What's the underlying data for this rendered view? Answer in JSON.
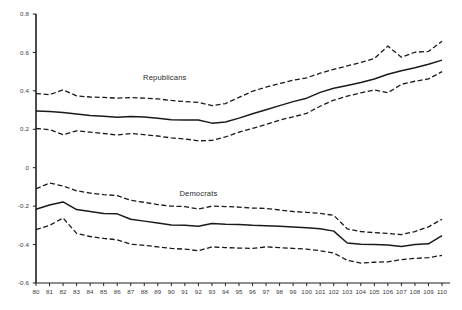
{
  "chart_data": {
    "type": "line",
    "title": "",
    "subtitle": "",
    "xlabel": "",
    "ylabel": "",
    "xlim": [
      80,
      110
    ],
    "ylim": [
      -0.6,
      0.8
    ],
    "grid": false,
    "legend_position": "inline-annotation",
    "x": [
      80,
      81,
      82,
      83,
      84,
      85,
      86,
      87,
      88,
      89,
      90,
      91,
      92,
      93,
      94,
      95,
      96,
      97,
      98,
      99,
      100,
      101,
      102,
      103,
      104,
      105,
      106,
      107,
      108,
      109,
      110
    ],
    "xtick_labels": [
      "80",
      "81",
      "82",
      "83",
      "84",
      "85",
      "86",
      "87",
      "88",
      "89",
      "90",
      "91",
      "92",
      "93",
      "94",
      "95",
      "96",
      "97",
      "98",
      "99",
      "100",
      "101",
      "102",
      "103",
      "104",
      "105",
      "106",
      "107",
      "108",
      "109",
      "110"
    ],
    "ytick_labels": [
      "0.8",
      "0.6",
      "0.4",
      "0.2",
      "0",
      "-0.2",
      "-0.4",
      "-0.6"
    ],
    "ytick_values": [
      0.8,
      0.6,
      0.4,
      0.2,
      0,
      -0.2,
      -0.4,
      -0.6
    ],
    "annotations": [
      {
        "text": "Republicans",
        "x": 89.5,
        "y": 0.465
      },
      {
        "text": "Democrats",
        "x": 92.0,
        "y": -0.135
      }
    ],
    "series": [
      {
        "name": "Republicans",
        "role": "mean",
        "style": "solid",
        "color": "#1a1a1a",
        "values": [
          0.295,
          0.292,
          0.288,
          0.28,
          0.272,
          0.268,
          0.263,
          0.266,
          0.264,
          0.258,
          0.25,
          0.248,
          0.248,
          0.232,
          0.238,
          0.258,
          0.281,
          0.302,
          0.323,
          0.344,
          0.362,
          0.392,
          0.414,
          0.428,
          0.443,
          0.462,
          0.486,
          0.505,
          0.52,
          0.538,
          0.56
        ]
      },
      {
        "name": "Republicans",
        "role": "upper",
        "style": "dashed",
        "color": "#1a1a1a",
        "values": [
          0.386,
          0.38,
          0.405,
          0.374,
          0.368,
          0.366,
          0.362,
          0.365,
          0.362,
          0.358,
          0.35,
          0.344,
          0.34,
          0.323,
          0.334,
          0.366,
          0.398,
          0.42,
          0.438,
          0.455,
          0.468,
          0.492,
          0.512,
          0.53,
          0.548,
          0.568,
          0.633,
          0.575,
          0.601,
          0.605,
          0.658
        ]
      },
      {
        "name": "Republicans",
        "role": "lower",
        "style": "dashed",
        "color": "#1a1a1a",
        "values": [
          0.204,
          0.198,
          0.172,
          0.192,
          0.185,
          0.178,
          0.17,
          0.178,
          0.172,
          0.165,
          0.155,
          0.15,
          0.14,
          0.142,
          0.16,
          0.185,
          0.205,
          0.225,
          0.248,
          0.265,
          0.283,
          0.32,
          0.352,
          0.372,
          0.39,
          0.405,
          0.39,
          0.434,
          0.45,
          0.462,
          0.5
        ]
      },
      {
        "name": "Democrats",
        "role": "mean",
        "style": "solid",
        "color": "#1a1a1a",
        "values": [
          -0.216,
          -0.194,
          -0.178,
          -0.218,
          -0.228,
          -0.238,
          -0.24,
          -0.268,
          -0.278,
          -0.288,
          -0.298,
          -0.3,
          -0.305,
          -0.29,
          -0.294,
          -0.296,
          -0.3,
          -0.302,
          -0.305,
          -0.308,
          -0.312,
          -0.318,
          -0.33,
          -0.392,
          -0.398,
          -0.4,
          -0.402,
          -0.41,
          -0.4,
          -0.396,
          -0.354
        ]
      },
      {
        "name": "Democrats",
        "role": "upper",
        "style": "dashed",
        "color": "#1a1a1a",
        "values": [
          -0.11,
          -0.08,
          -0.095,
          -0.12,
          -0.132,
          -0.14,
          -0.145,
          -0.17,
          -0.18,
          -0.192,
          -0.2,
          -0.202,
          -0.215,
          -0.2,
          -0.202,
          -0.205,
          -0.21,
          -0.212,
          -0.22,
          -0.228,
          -0.232,
          -0.238,
          -0.248,
          -0.318,
          -0.332,
          -0.338,
          -0.342,
          -0.348,
          -0.332,
          -0.308,
          -0.268
        ]
      },
      {
        "name": "Democrats",
        "role": "lower",
        "style": "dashed",
        "color": "#1a1a1a",
        "values": [
          -0.322,
          -0.3,
          -0.262,
          -0.342,
          -0.358,
          -0.368,
          -0.375,
          -0.398,
          -0.404,
          -0.412,
          -0.42,
          -0.424,
          -0.432,
          -0.412,
          -0.416,
          -0.418,
          -0.42,
          -0.412,
          -0.416,
          -0.42,
          -0.424,
          -0.432,
          -0.444,
          -0.482,
          -0.496,
          -0.492,
          -0.49,
          -0.478,
          -0.472,
          -0.468,
          -0.456
        ]
      }
    ]
  }
}
